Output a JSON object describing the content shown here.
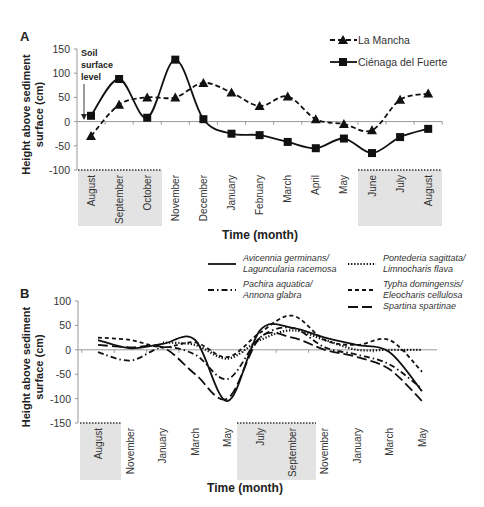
{
  "chart_data": [
    {
      "panel": "A",
      "type": "line",
      "title": "",
      "xlabel": "Time (month)",
      "ylabel": "Height above sediment surface (cm)",
      "ylim": [
        -100,
        150
      ],
      "yticks": [
        150,
        100,
        50,
        0,
        -50,
        -100
      ],
      "categories": [
        "August",
        "September",
        "October",
        "November",
        "December",
        "January",
        "February",
        "March",
        "April",
        "May",
        "June",
        "July",
        "August"
      ],
      "shaded_ranges": [
        [
          0,
          2
        ],
        [
          10,
          12
        ]
      ],
      "annotation": {
        "lines": [
          "Soil",
          "surface",
          "level"
        ]
      },
      "legend_position": "top-right",
      "series": [
        {
          "name": "La Mancha",
          "style": "dashed",
          "marker": "triangle",
          "values": [
            -30,
            35,
            50,
            50,
            80,
            60,
            32,
            52,
            5,
            -5,
            -18,
            45,
            58
          ]
        },
        {
          "name": "Ciénaga del Fuerte",
          "style": "solid",
          "marker": "square",
          "values": [
            12,
            88,
            8,
            128,
            5,
            -25,
            -28,
            -42,
            -55,
            -35,
            -65,
            -32,
            -15
          ]
        }
      ]
    },
    {
      "panel": "B",
      "type": "line",
      "title": "",
      "xlabel": "Time (month)",
      "ylabel": "Height above sediment surface (cm)",
      "ylim": [
        -150,
        100
      ],
      "yticks": [
        100,
        50,
        0,
        -50,
        -100,
        -150
      ],
      "categories": [
        "August",
        "November",
        "January",
        "March",
        "May",
        "July",
        "September",
        "November",
        "January",
        "March",
        "May"
      ],
      "shaded_ranges": [
        [
          0,
          0.4
        ],
        [
          5,
          7
        ]
      ],
      "legend_position": "top-right",
      "series": [
        {
          "name": "Avicennia germinans/ Laguncularia racemosa",
          "legend_lines": [
            "Avicennia germinans/",
            "Laguncularia racemosa"
          ],
          "style": "solid",
          "values": [
            20,
            3,
            12,
            20,
            -105,
            40,
            45,
            25,
            10,
            -5,
            -85
          ]
        },
        {
          "name": "Pachira aquatica/ Annona glabra",
          "legend_lines": [
            "Pachira aquatica/",
            "Annona glabra"
          ],
          "style": "dash-dot",
          "values": [
            -5,
            -22,
            5,
            -10,
            -60,
            25,
            45,
            5,
            -10,
            -30,
            -80
          ]
        },
        {
          "name": "Pontederia sagittata/ Limnocharis flava",
          "legend_lines": [
            "Pontederia sagittata/",
            "Limnocharis flava"
          ],
          "style": "dotted",
          "values": [
            null,
            null,
            15,
            10,
            -18,
            20,
            40,
            20,
            0,
            0,
            0
          ]
        },
        {
          "name": "Typha domingensis/ Eleocharis cellulosa",
          "legend_lines": [
            "Typha domingensis/",
            "Eleocharis cellulosa"
          ],
          "style": "short-dashed",
          "values": [
            25,
            20,
            5,
            15,
            -15,
            35,
            70,
            20,
            10,
            20,
            -45
          ]
        },
        {
          "name": "Spartina spartinae",
          "legend_lines": [
            "Spartina spartinae"
          ],
          "style": "long-dashed",
          "values": [
            10,
            5,
            5,
            -50,
            -100,
            25,
            25,
            0,
            -15,
            -40,
            -105
          ]
        }
      ]
    }
  ],
  "labels": {
    "panel_a": "A",
    "panel_b": "B",
    "ylabel_line1": "Height above sediment",
    "ylabel_line2": "surface (cm)"
  }
}
